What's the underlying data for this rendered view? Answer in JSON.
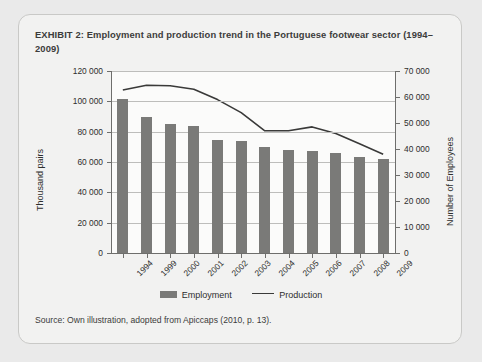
{
  "exhibit": {
    "title": "EXHIBIT 2:  Employment and production trend in the Portuguese footwear sector (1994–2009)",
    "source": "Source: Own illustration, adopted from Apiccaps (2010, p. 13)."
  },
  "chart_data": {
    "type": "bar",
    "title": "Employment and production trend in the Portuguese footwear sector (1994–2009)",
    "categories": [
      "1994",
      "1999",
      "2000",
      "2001",
      "2002",
      "2003",
      "2004",
      "2005",
      "2006",
      "2007",
      "2008",
      "2009"
    ],
    "series": [
      {
        "name": "Employment",
        "type": "bar",
        "axis": "left",
        "values": [
          101500,
          90000,
          85000,
          83500,
          74500,
          74000,
          70000,
          68000,
          67000,
          66000,
          63000,
          62000
        ]
      },
      {
        "name": "Production",
        "type": "line",
        "axis": "right",
        "values": [
          62700,
          64500,
          64300,
          63000,
          59000,
          54000,
          47000,
          47000,
          48500,
          46000,
          42000,
          38000
        ]
      }
    ],
    "xlabel": "",
    "ylabel": "Thousand pairs",
    "y2label": "Number of Employees",
    "ylim": [
      0,
      120000
    ],
    "y2lim": [
      0,
      70000
    ],
    "yticks": [
      "0",
      "20 000",
      "40 000",
      "60 000",
      "80 000",
      "100 000",
      "120 000"
    ],
    "ytick_values": [
      0,
      20000,
      40000,
      60000,
      80000,
      100000,
      120000
    ],
    "y2ticks": [
      "0",
      "10 000",
      "20 000",
      "30 000",
      "40 000",
      "50 000",
      "60 000",
      "70 000"
    ],
    "y2tick_values": [
      0,
      10000,
      20000,
      30000,
      40000,
      50000,
      60000,
      70000
    ],
    "grid": true,
    "legend": [
      "Employment",
      "Production"
    ],
    "legend_position": "bottom",
    "colors": {
      "bar": "#7a7a78",
      "line": "#3a3a39",
      "grid": "#bdbdbb",
      "axis": "#6e6e6c",
      "plot_background": "#fbfbfa",
      "card_background": "#f2f2f1",
      "page_background": "#eaeaea"
    }
  }
}
